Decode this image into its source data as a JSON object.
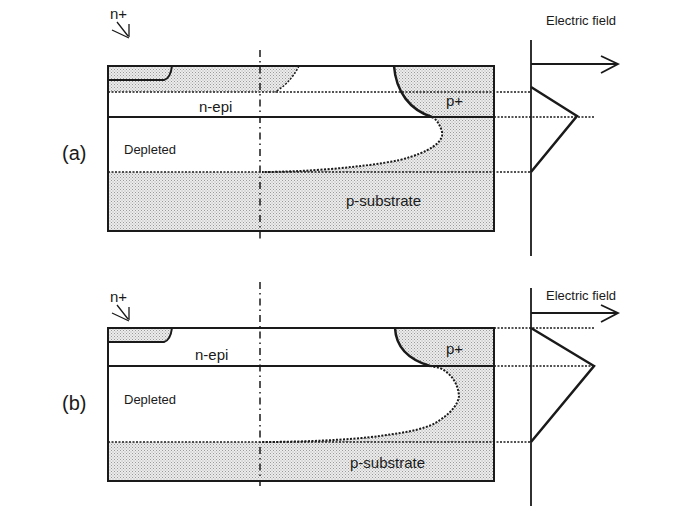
{
  "figure": {
    "panels": [
      {
        "id": "a",
        "label": "(a)",
        "regions": {
          "n_plus": "n+",
          "n_epi": "n-epi",
          "depleted": "Depleted",
          "p_plus": "p+",
          "p_substrate": "p-substrate"
        },
        "axis_label": "Electric field"
      },
      {
        "id": "b",
        "label": "(b)",
        "regions": {
          "n_plus": "n+",
          "n_epi": "n-epi",
          "depleted": "Depleted",
          "p_plus": "p+",
          "p_substrate": "p-substrate"
        },
        "axis_label": "Electric field"
      }
    ],
    "colors": {
      "line": "#1a1a1a",
      "shading": "#d4d4d4",
      "background": "#ffffff"
    }
  }
}
